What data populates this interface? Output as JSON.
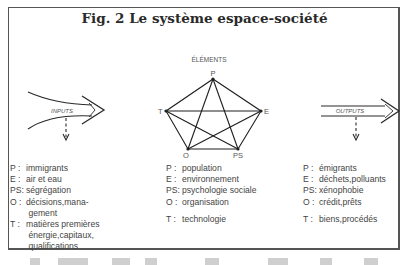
{
  "figure": {
    "title": "Fig. 2 Le système espace-société",
    "elements_heading": "ÉLÉMENTS",
    "inputs_label": "INPUTS",
    "outputs_label": "OUTPUTS",
    "nodes": {
      "P": "P",
      "E": "E",
      "PS": "PS",
      "O": "O",
      "T": "T"
    }
  },
  "legend": {
    "inputs": [
      {
        "key": "P :",
        "value": "immigrants"
      },
      {
        "key": "E :",
        "value": "air et eau"
      },
      {
        "key": "PS:",
        "value": "ségrégation"
      },
      {
        "key": "O :",
        "value": "décisions,mana-\n gement"
      },
      {
        "key": "T :",
        "value": "matières premières\n énergie,capitaux,\n qualifications"
      }
    ],
    "elements": [
      {
        "key": "P :",
        "value": "population"
      },
      {
        "key": "E :",
        "value": "environnement"
      },
      {
        "key": "PS:",
        "value": "psychologie sociale"
      },
      {
        "key": "O :",
        "value": "organisation"
      },
      {
        "key": "T :",
        "value": "technologie"
      }
    ],
    "outputs": [
      {
        "key": "P :",
        "value": "émigrants"
      },
      {
        "key": "E :",
        "value": "déchets,polluants"
      },
      {
        "key": "PS:",
        "value": "xénophobie"
      },
      {
        "key": "O :",
        "value": "crédit,prêts"
      },
      {
        "key": "T :",
        "value": "biens,procédés"
      }
    ]
  },
  "colors": {
    "line": "#2a2a2a",
    "text": "#444444",
    "frame": "#555555"
  }
}
